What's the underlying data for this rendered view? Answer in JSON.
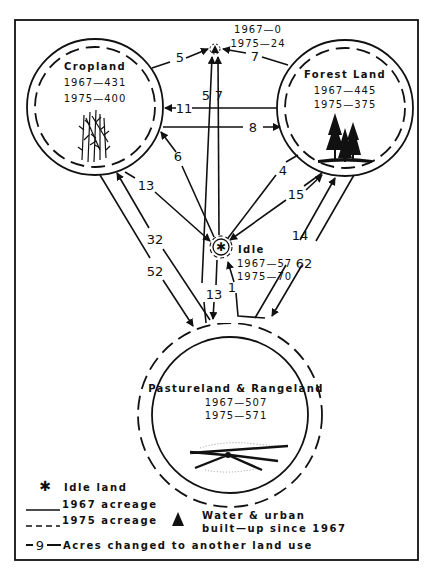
{
  "diagram": {
    "nodes": {
      "cropland": {
        "name": "Cropland",
        "y1967": "1967—431",
        "y1975": "1975—400"
      },
      "forest": {
        "name": "Forest Land",
        "y1967": "1967—445",
        "y1975": "1975—375"
      },
      "pasture": {
        "name": "Pastureland & Rangeland",
        "y1967": "1967—507",
        "y1975": "1975—571"
      },
      "idle": {
        "name": "Idle",
        "y1967": "1967—57",
        "y1975": "1975—70"
      },
      "water_urban": {
        "y1967": "1967—0",
        "y1975": "1975—24"
      }
    },
    "flows": [
      {
        "from": "cropland",
        "to": "water_urban",
        "value": "5"
      },
      {
        "from": "forest",
        "to": "water_urban",
        "value": "7"
      },
      {
        "from": "pasture",
        "to": "water_urban",
        "value": "5"
      },
      {
        "from": "idle",
        "to": "water_urban",
        "value": "7"
      },
      {
        "from": "forest",
        "to": "cropland",
        "value": "11"
      },
      {
        "from": "cropland",
        "to": "forest",
        "value": "8"
      },
      {
        "from": "idle",
        "to": "cropland",
        "value": "6"
      },
      {
        "from": "cropland",
        "to": "idle",
        "value": "13"
      },
      {
        "from": "idle",
        "to": "forest",
        "value": "4"
      },
      {
        "from": "forest",
        "to": "idle",
        "value": "15"
      },
      {
        "from": "pasture",
        "to": "cropland",
        "value": "32"
      },
      {
        "from": "cropland",
        "to": "pasture",
        "value": "52"
      },
      {
        "from": "pasture",
        "to": "forest",
        "value": "14"
      },
      {
        "from": "forest",
        "to": "pasture",
        "value": "62"
      },
      {
        "from": "idle",
        "to": "pasture",
        "value": "13"
      },
      {
        "from": "pasture",
        "to": "idle",
        "value": "1"
      }
    ],
    "legend": {
      "idle_land": "Idle land",
      "acreage_1967": "1967 acreage",
      "acreage_1975": "1975 acreage",
      "water_urban_line1": "Water & urban",
      "water_urban_line2": "built—up since 1967",
      "flow_sample": "9",
      "flow_desc": "Acres changed to another land use"
    }
  }
}
